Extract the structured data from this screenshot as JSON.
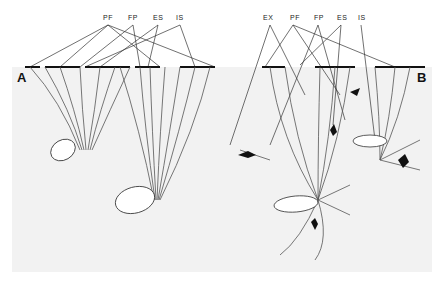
{
  "figure": {
    "panel_a": {
      "letter": "A",
      "labels": [
        "PF",
        "FP",
        "ES",
        "IS"
      ]
    },
    "panel_b": {
      "letter": "B",
      "labels": [
        "EX",
        "PF",
        "FP",
        "ES",
        "IS"
      ]
    },
    "colors": {
      "soil": "#f2f2f2",
      "ink": "#222222",
      "background": "#ffffff"
    }
  }
}
